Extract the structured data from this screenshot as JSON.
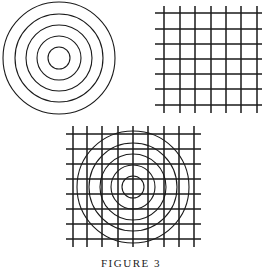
{
  "figure": {
    "caption": "FIGURE 3",
    "stroke_color": "#1a1a1a",
    "background": "#ffffff"
  },
  "panels": {
    "concentric_circles": {
      "center": [
        59,
        58
      ],
      "radii": [
        11,
        22,
        33,
        44,
        56
      ]
    },
    "grid": {
      "horizontal_y": [
        13,
        29,
        44,
        59,
        74,
        89,
        105
      ],
      "h_span": [
        155,
        262
      ],
      "vertical_x": [
        164,
        180,
        195,
        211,
        226,
        241,
        257
      ],
      "v_span": [
        6,
        113
      ]
    },
    "combined": {
      "horizontal_y": [
        134,
        149,
        164,
        179,
        194,
        209,
        224,
        239
      ],
      "h_span": [
        66,
        201
      ],
      "vertical_x": [
        73,
        87,
        102,
        118,
        133,
        148,
        164,
        179,
        194
      ],
      "v_span": [
        126,
        247
      ],
      "center": [
        133,
        187
      ],
      "radii": [
        11,
        22,
        33,
        44,
        56
      ]
    }
  }
}
